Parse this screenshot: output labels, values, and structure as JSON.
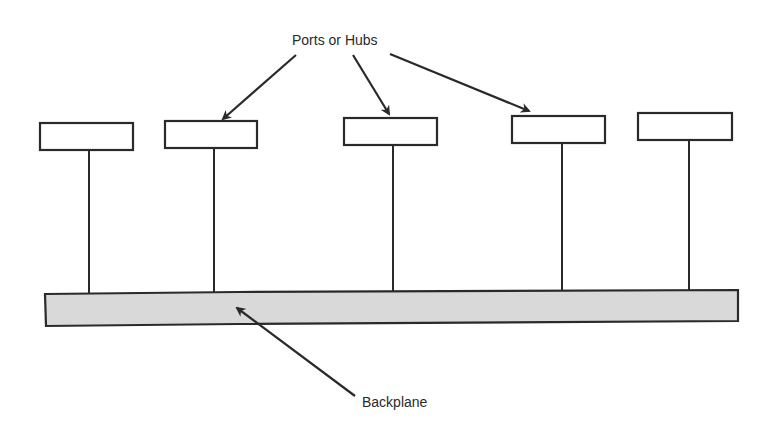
{
  "diagram": {
    "labels": {
      "ports": "Ports or Hubs",
      "backplane": "Backplane"
    },
    "colors": {
      "stroke": "#2a2a2a",
      "backplane_fill": "#d9d9d9",
      "box_fill": "#ffffff",
      "background": "#ffffff"
    },
    "ports": [
      {
        "id": 1,
        "x": 40,
        "y": 123,
        "w": 93,
        "h": 27,
        "stem_x": 89
      },
      {
        "id": 2,
        "x": 165,
        "y": 121,
        "w": 92,
        "h": 27,
        "stem_x": 214
      },
      {
        "id": 3,
        "x": 344,
        "y": 118,
        "w": 93,
        "h": 27,
        "stem_x": 393
      },
      {
        "id": 4,
        "x": 512,
        "y": 116,
        "w": 93,
        "h": 27,
        "stem_x": 562
      },
      {
        "id": 5,
        "x": 638,
        "y": 113,
        "w": 94,
        "h": 27,
        "stem_x": 689
      }
    ],
    "backplane": {
      "x": 45,
      "y": 290,
      "w": 693,
      "h": 35
    },
    "arrows": [
      {
        "from": [
          296,
          55
        ],
        "to": [
          222,
          120
        ],
        "target": "port-2"
      },
      {
        "from": [
          353,
          55
        ],
        "to": [
          389,
          115
        ],
        "target": "port-3"
      },
      {
        "from": [
          390,
          54
        ],
        "to": [
          530,
          112
        ],
        "target": "port-4"
      },
      {
        "from": [
          355,
          396
        ],
        "to": [
          236,
          307
        ],
        "target": "backplane"
      }
    ]
  }
}
